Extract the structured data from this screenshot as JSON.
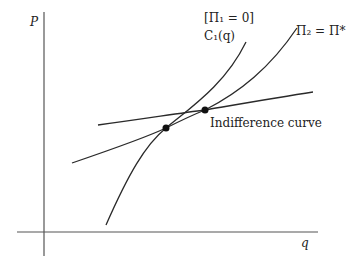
{
  "diagram": {
    "axes": {
      "y_label": "P",
      "x_label": "q"
    },
    "curves": [
      {
        "id": "c1",
        "label_line1": "[Π₁ = 0]",
        "label_line2": "C₁(q)"
      },
      {
        "id": "pi2",
        "label": "Π₂ = Π*"
      },
      {
        "id": "indifference",
        "label": "Indifference curve"
      }
    ],
    "points": [
      {
        "id": "intersection-c1-pi2",
        "x": 166,
        "y": 128
      },
      {
        "id": "tangency-pi2-indifference",
        "x": 205,
        "y": 110
      }
    ],
    "colors": {
      "line": "#2a2a2a",
      "axis": "#555555",
      "background": "#ffffff"
    }
  }
}
